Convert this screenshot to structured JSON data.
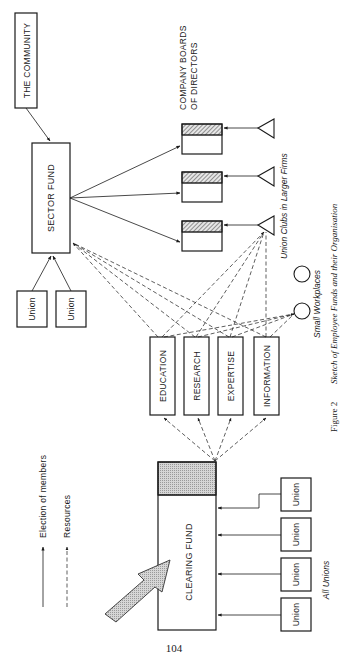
{
  "diagram": {
    "community": "THE COMMUNITY",
    "sector_fund": "SECTOR FUND",
    "clearing_fund": "CLEARING FUND",
    "company_boards": {
      "line1": "COMPANY  BOARDS",
      "line2": "OF DIRECTORS"
    },
    "sector_unions": [
      "Union",
      "Union"
    ],
    "resources": [
      "EDUCATION",
      "RESEARCH",
      "EXPERTISE",
      "INFORMATION"
    ],
    "clearing_unions": [
      "Union",
      "Union",
      "Union",
      "Union"
    ],
    "union_clubs_label": "Union Clubs in Larger Firms",
    "small_workplaces_label": "Small Workplaces",
    "all_unions_label": "All Unions",
    "legend": {
      "election": "Election of members",
      "resources": "Resources"
    }
  },
  "caption": {
    "figure": "Figure 2",
    "title": "Sketch of Employee Funds and their Organisation"
  },
  "page_number": "104",
  "colors": {
    "ink": "#1a1a1a",
    "hatch_fill": "#bdbdbd",
    "stipple_fill": "#c9c9c9"
  }
}
